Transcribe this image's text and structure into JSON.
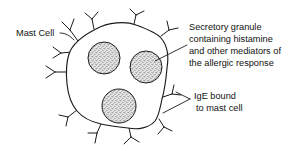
{
  "figure": {
    "background_color": "#ffffff",
    "ink_color": "#1a1a1a",
    "granule_fill_color": "#d8d8d8"
  },
  "labels": {
    "mast_cell": "Mast Cell",
    "secretory_granule": [
      "Secretory granule",
      "containing histamine",
      "and other mediators of",
      "the allergic response"
    ],
    "ige_bound": [
      "IgE bound",
      "to mast cell"
    ]
  },
  "diagram": {
    "cell_name": "mast-cell-body",
    "granule_count": 3,
    "granules": [
      {
        "name": "granule-upper-left",
        "cx": 104,
        "cy": 58,
        "r": 16
      },
      {
        "name": "granule-right",
        "cx": 146,
        "cy": 67,
        "r": 16
      },
      {
        "name": "granule-lower-center",
        "cx": 119,
        "cy": 106,
        "r": 17
      }
    ],
    "receptor_count": 11,
    "receptor_name": "ige-receptor"
  }
}
